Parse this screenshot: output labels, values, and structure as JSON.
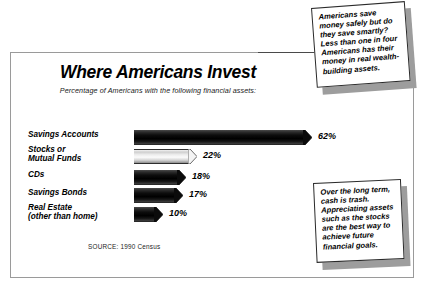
{
  "chart_data": {
    "type": "bar",
    "title": "Where Americans Invest",
    "subtitle": "Percentage of Americans with the following financial assets:",
    "orientation": "horizontal",
    "categories": [
      "Savings Accounts",
      "Stocks or\nMutual Funds",
      "CDs",
      "Savings Bonds",
      "Real Estate\n(other than home)"
    ],
    "values": [
      62,
      22,
      18,
      17,
      10
    ],
    "value_labels": [
      "62%",
      "22%",
      "18%",
      "17%",
      "10%"
    ],
    "xlabel": "",
    "ylabel": "",
    "xlim": [
      0,
      62
    ],
    "grid": false,
    "legend": false,
    "highlight_index": 1,
    "highlight_note": "Stocks or Mutual Funds bar drawn in light/white fill; all others solid black",
    "source": "SOURCE: 1990 Census"
  },
  "callouts": [
    {
      "id": "callout-top",
      "text": "Americans save money safely but do they save smartly? Less than one in four Americans has their money in real wealth-building assets."
    },
    {
      "id": "callout-bottom",
      "text": "Over the long term, cash is trash. Appreciating assets such as the stocks are the best way to achieve future financial goals."
    }
  ],
  "colors": {
    "bar_dark": "#000000",
    "bar_light": "#f2f2f2",
    "frame": "#9a9a9a",
    "text": "#000000",
    "shadow": "#9d9d9d",
    "background": "#ffffff"
  }
}
